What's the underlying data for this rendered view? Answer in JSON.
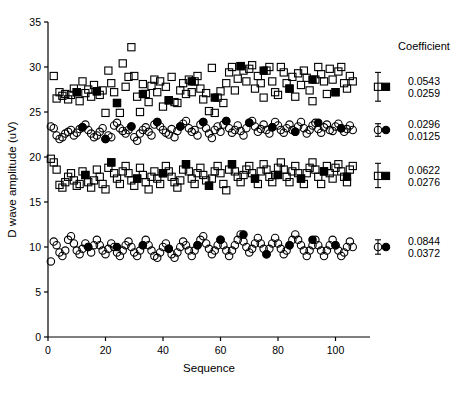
{
  "figure": {
    "background": "#ffffff",
    "ink": "#000000"
  },
  "axes": {
    "x": {
      "label": "Sequence",
      "ticks": [
        0,
        20,
        40,
        60,
        80,
        100
      ],
      "tick_labels": [
        "0",
        "20",
        "40",
        "60",
        "80",
        "100"
      ],
      "min": 0,
      "max": 112
    },
    "y": {
      "label": "D wave amplitude  (uV)",
      "ticks": [
        0,
        5,
        10,
        15,
        20,
        25,
        30,
        35
      ],
      "tick_labels": [
        "0",
        "5",
        "10",
        "15",
        "20",
        "25",
        "30",
        "35"
      ],
      "min": 0,
      "max": 35
    }
  },
  "legend": {
    "coefficient_header": "Coefficient",
    "entries": [
      {
        "series": "series-1",
        "values": [
          "0.0543",
          "0.0259"
        ]
      },
      {
        "series": "series-2",
        "values": [
          "0.0296",
          "0.0125"
        ]
      },
      {
        "series": "series-3",
        "values": [
          "0.0622",
          "0.0276"
        ]
      },
      {
        "series": "series-4",
        "values": [
          "0.0844",
          "0.0372"
        ]
      }
    ]
  },
  "summary_markers": [
    {
      "series": "series-1",
      "marker": "square-open",
      "y": 27.8,
      "err_low": 26.2,
      "err_high": 29.4,
      "filled_marker": "square-filled",
      "filled_y": 27.8
    },
    {
      "series": "series-2",
      "marker": "circle-open",
      "y": 23.0,
      "err_low": 22.3,
      "err_high": 23.7,
      "filled_marker": "circle-filled",
      "filled_y": 23.0
    },
    {
      "series": "series-3",
      "marker": "square-open",
      "y": 17.9,
      "err_low": 16.6,
      "err_high": 19.3,
      "filled_marker": "square-filled",
      "filled_y": 17.9
    },
    {
      "series": "series-4",
      "marker": "circle-open",
      "y": 10.0,
      "err_low": 9.2,
      "err_high": 10.8,
      "filled_marker": "circle-filled",
      "filled_y": 10.0
    }
  ],
  "chart_data": {
    "type": "scatter",
    "title": "",
    "xlabel": "Sequence",
    "ylabel": "D wave amplitude  (uV)",
    "xlim": [
      0,
      112
    ],
    "ylim": [
      0,
      35
    ],
    "grid": false,
    "legend_position": "right",
    "series": [
      {
        "name": "series-1",
        "marker": "square-open",
        "filled_marker": "square-filled",
        "mean": 27.8,
        "x": [
          2,
          3,
          4,
          5,
          6,
          7,
          8,
          9,
          10,
          11,
          12,
          13,
          14,
          15,
          16,
          17,
          18,
          19,
          20,
          21,
          22,
          23,
          24,
          25,
          26,
          27,
          28,
          29,
          30,
          31,
          32,
          33,
          34,
          35,
          36,
          37,
          38,
          39,
          40,
          41,
          42,
          43,
          44,
          45,
          46,
          47,
          48,
          49,
          50,
          51,
          52,
          53,
          54,
          55,
          56,
          57,
          58,
          59,
          60,
          61,
          62,
          63,
          64,
          65,
          66,
          67,
          68,
          69,
          70,
          71,
          72,
          73,
          74,
          75,
          76,
          77,
          78,
          79,
          80,
          81,
          82,
          83,
          84,
          85,
          86,
          87,
          88,
          89,
          90,
          91,
          92,
          93,
          94,
          95,
          96,
          97,
          98,
          99,
          100,
          101,
          102,
          103,
          104,
          105,
          106
        ],
        "y": [
          29.0,
          26.5,
          27.2,
          26.8,
          27.0,
          26.4,
          26.9,
          27.6,
          27.2,
          26.2,
          28.4,
          27.1,
          27.5,
          26.7,
          28.0,
          27.3,
          26.9,
          27.4,
          24.9,
          29.6,
          28.2,
          27.2,
          26.0,
          24.9,
          30.4,
          27.8,
          28.9,
          32.2,
          29.0,
          26.7,
          25.0,
          28.1,
          27.0,
          26.1,
          27.9,
          28.6,
          27.2,
          28.4,
          25.6,
          27.8,
          26.3,
          28.9,
          26.1,
          26.0,
          27.4,
          28.2,
          27.0,
          28.6,
          27.2,
          28.4,
          29.0,
          27.6,
          26.4,
          27.1,
          25.1,
          29.9,
          24.9,
          26.6,
          27.3,
          26.0,
          28.2,
          29.4,
          30.0,
          27.4,
          28.7,
          30.1,
          29.6,
          28.4,
          29.8,
          30.2,
          27.6,
          29.0,
          28.2,
          26.6,
          29.6,
          30.0,
          28.4,
          27.2,
          26.9,
          30.0,
          29.4,
          28.2,
          27.6,
          28.9,
          26.7,
          29.3,
          28.0,
          29.6,
          28.8,
          27.4,
          26.2,
          28.6,
          30.0,
          29.2,
          28.4,
          27.0,
          29.8,
          28.6,
          27.2,
          29.5,
          30.0,
          28.2,
          27.6,
          29.0,
          28.4
        ],
        "filled_x": [
          10,
          17,
          24,
          33,
          42,
          50,
          58,
          67,
          75,
          84,
          92,
          100
        ],
        "filled_y": [
          27.2,
          27.3,
          26.0,
          27.0,
          26.3,
          28.4,
          26.6,
          30.1,
          29.6,
          27.6,
          28.6,
          27.2
        ]
      },
      {
        "name": "series-2",
        "marker": "circle-open",
        "filled_marker": "circle-filled",
        "mean": 23.0,
        "x": [
          1,
          2,
          3,
          4,
          5,
          6,
          7,
          8,
          9,
          10,
          11,
          12,
          13,
          14,
          15,
          16,
          17,
          18,
          19,
          20,
          21,
          22,
          23,
          24,
          25,
          26,
          27,
          28,
          29,
          30,
          31,
          32,
          33,
          34,
          35,
          36,
          37,
          38,
          39,
          40,
          41,
          42,
          43,
          44,
          45,
          46,
          47,
          48,
          49,
          50,
          51,
          52,
          53,
          54,
          55,
          56,
          57,
          58,
          59,
          60,
          61,
          62,
          63,
          64,
          65,
          66,
          67,
          68,
          69,
          70,
          71,
          72,
          73,
          74,
          75,
          76,
          77,
          78,
          79,
          80,
          81,
          82,
          83,
          84,
          85,
          86,
          87,
          88,
          89,
          90,
          91,
          92,
          93,
          94,
          95,
          96,
          97,
          98,
          99,
          100,
          101,
          102,
          103,
          104,
          105,
          106
        ],
        "y": [
          23.4,
          23.2,
          22.4,
          22.0,
          22.2,
          22.6,
          22.8,
          23.0,
          22.4,
          22.7,
          23.1,
          23.3,
          23.6,
          23.0,
          22.6,
          22.2,
          22.4,
          22.8,
          23.2,
          22.0,
          22.4,
          22.2,
          23.5,
          23.8,
          23.2,
          22.9,
          22.6,
          23.0,
          23.4,
          22.2,
          21.8,
          22.6,
          23.0,
          23.3,
          22.8,
          22.4,
          23.6,
          23.9,
          23.4,
          23.0,
          22.7,
          22.5,
          23.1,
          22.2,
          22.9,
          23.4,
          23.7,
          24.0,
          23.2,
          22.8,
          23.0,
          22.4,
          23.6,
          23.9,
          23.2,
          22.6,
          22.1,
          23.0,
          23.4,
          22.8,
          23.6,
          24.0,
          23.2,
          22.7,
          23.0,
          23.5,
          22.9,
          22.4,
          23.2,
          23.8,
          24.0,
          23.4,
          22.8,
          23.1,
          23.6,
          23.0,
          22.6,
          23.3,
          23.9,
          23.5,
          23.0,
          22.7,
          23.2,
          23.6,
          23.0,
          22.8,
          23.4,
          23.9,
          23.2,
          22.6,
          23.0,
          23.5,
          23.8,
          23.1,
          22.7,
          23.3,
          23.6,
          23.0,
          22.9,
          23.4,
          23.7,
          23.2,
          22.8,
          23.1,
          23.5,
          23.0
        ],
        "filled_x": [
          12,
          20,
          29,
          38,
          46,
          54,
          62,
          70,
          78,
          86,
          94,
          102
        ],
        "filled_y": [
          23.3,
          22.0,
          23.4,
          23.9,
          23.4,
          23.9,
          24.0,
          23.8,
          23.3,
          22.8,
          23.8,
          23.2
        ]
      },
      {
        "name": "series-3",
        "marker": "square-open",
        "filled_marker": "square-filled",
        "mean": 17.9,
        "x": [
          1,
          2,
          3,
          4,
          5,
          6,
          7,
          8,
          9,
          10,
          11,
          12,
          13,
          14,
          15,
          16,
          17,
          18,
          19,
          20,
          21,
          22,
          23,
          24,
          25,
          26,
          27,
          28,
          29,
          30,
          31,
          32,
          33,
          34,
          35,
          36,
          37,
          38,
          39,
          40,
          41,
          42,
          43,
          44,
          45,
          46,
          47,
          48,
          49,
          50,
          51,
          52,
          53,
          54,
          55,
          56,
          57,
          58,
          59,
          60,
          61,
          62,
          63,
          64,
          65,
          66,
          67,
          68,
          69,
          70,
          71,
          72,
          73,
          74,
          75,
          76,
          77,
          78,
          79,
          80,
          81,
          82,
          83,
          84,
          85,
          86,
          87,
          88,
          89,
          90,
          91,
          92,
          93,
          94,
          95,
          96,
          97,
          98,
          99,
          100,
          101,
          102,
          103,
          104,
          105,
          106
        ],
        "y": [
          19.8,
          19.4,
          18.6,
          16.9,
          16.6,
          17.2,
          17.8,
          18.2,
          17.4,
          16.8,
          17.0,
          18.4,
          18.0,
          17.2,
          16.6,
          17.4,
          18.6,
          17.8,
          17.0,
          16.4,
          18.8,
          19.4,
          18.2,
          17.6,
          17.0,
          18.4,
          19.0,
          18.2,
          17.4,
          16.8,
          17.6,
          18.8,
          18.0,
          17.2,
          16.4,
          17.8,
          18.4,
          17.6,
          17.0,
          18.2,
          19.0,
          18.4,
          17.8,
          17.2,
          16.6,
          17.4,
          18.6,
          19.2,
          18.4,
          17.6,
          17.0,
          18.2,
          18.8,
          18.0,
          17.4,
          16.8,
          17.6,
          18.4,
          19.0,
          18.2,
          17.0,
          16.3,
          18.6,
          19.2,
          18.4,
          17.8,
          17.2,
          18.0,
          18.6,
          19.0,
          18.2,
          17.6,
          17.0,
          18.4,
          19.2,
          18.6,
          17.8,
          17.2,
          18.0,
          18.8,
          19.4,
          18.6,
          17.8,
          17.2,
          18.4,
          19.0,
          18.2,
          17.6,
          17.0,
          18.2,
          18.8,
          19.4,
          18.6,
          17.8,
          17.0,
          18.4,
          19.0,
          18.2,
          17.6,
          18.8,
          19.2,
          18.4,
          17.8,
          17.2,
          18.6,
          19.0
        ],
        "filled_x": [
          13,
          22,
          31,
          40,
          48,
          56,
          64,
          72,
          80,
          88,
          96,
          104
        ],
        "filled_y": [
          18.0,
          19.4,
          17.6,
          18.2,
          19.2,
          16.8,
          19.2,
          17.6,
          18.0,
          17.6,
          18.4,
          17.8
        ]
      },
      {
        "name": "series-4",
        "marker": "circle-open",
        "filled_marker": "circle-filled",
        "mean": 10.0,
        "x": [
          1,
          2,
          3,
          4,
          5,
          6,
          7,
          8,
          9,
          10,
          11,
          12,
          13,
          14,
          15,
          16,
          17,
          18,
          19,
          20,
          21,
          22,
          23,
          24,
          25,
          26,
          27,
          28,
          29,
          30,
          31,
          32,
          33,
          34,
          35,
          36,
          37,
          38,
          39,
          40,
          41,
          42,
          43,
          44,
          45,
          46,
          47,
          48,
          49,
          50,
          51,
          52,
          53,
          54,
          55,
          56,
          57,
          58,
          59,
          60,
          61,
          62,
          63,
          64,
          65,
          66,
          67,
          68,
          69,
          70,
          71,
          72,
          73,
          74,
          75,
          76,
          77,
          78,
          79,
          80,
          81,
          82,
          83,
          84,
          85,
          86,
          87,
          88,
          89,
          90,
          91,
          92,
          93,
          94,
          95,
          96,
          97,
          98,
          99,
          100,
          101,
          102,
          103,
          104,
          105,
          106
        ],
        "y": [
          8.4,
          10.6,
          10.2,
          9.4,
          9.0,
          9.6,
          10.8,
          11.2,
          10.4,
          9.6,
          9.2,
          9.8,
          10.4,
          10.0,
          9.4,
          10.2,
          10.8,
          10.2,
          9.6,
          9.2,
          9.8,
          10.4,
          10.0,
          9.4,
          9.0,
          9.6,
          10.2,
          10.6,
          10.0,
          9.4,
          9.0,
          9.6,
          10.2,
          10.8,
          10.2,
          9.6,
          9.0,
          8.8,
          9.4,
          10.0,
          10.4,
          9.8,
          9.2,
          8.8,
          9.4,
          10.0,
          10.6,
          10.2,
          9.6,
          9.0,
          9.6,
          10.2,
          10.8,
          11.2,
          10.4,
          9.8,
          9.2,
          9.6,
          10.2,
          10.8,
          10.2,
          9.6,
          9.0,
          9.6,
          10.2,
          10.8,
          11.4,
          10.6,
          10.0,
          9.4,
          9.8,
          10.4,
          11.0,
          10.4,
          9.8,
          9.2,
          9.8,
          10.4,
          11.0,
          10.4,
          9.8,
          9.2,
          9.6,
          10.2,
          10.8,
          11.4,
          10.8,
          10.2,
          9.6,
          9.0,
          9.6,
          10.2,
          10.8,
          10.2,
          9.6,
          9.0,
          9.6,
          10.2,
          10.8,
          10.2,
          9.6,
          9.0,
          9.4,
          10.0,
          10.6,
          10.0
        ],
        "filled_x": [
          14,
          24,
          33,
          42,
          52,
          60,
          68,
          76,
          84,
          92,
          100
        ],
        "filled_y": [
          10.0,
          10.0,
          10.2,
          9.8,
          10.2,
          10.8,
          11.4,
          9.2,
          10.2,
          10.8,
          10.2
        ]
      }
    ]
  }
}
